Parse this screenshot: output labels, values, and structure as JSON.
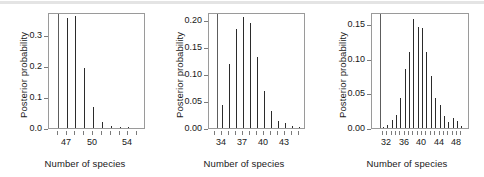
{
  "figure": {
    "panel_count": 3,
    "axis_color": "#7b7b7b",
    "box_color": "#9a9a9a",
    "spike_color": "#2b2b2b",
    "refline_color": "#5d5d5d",
    "background": "#ffffff"
  },
  "chart_data": [
    {
      "type": "bar",
      "title": "",
      "xlabel": "Number of species",
      "ylabel": "Posterior probability",
      "xlim": [
        45.0,
        56.0
      ],
      "ylim": [
        0.0,
        0.375
      ],
      "xticks": [
        47,
        50,
        54
      ],
      "xtick_labels": [
        "47",
        "50",
        "54"
      ],
      "xtick_minor": [
        46,
        47,
        48,
        49,
        50,
        51,
        52,
        53,
        54,
        55
      ],
      "yticks": [
        0.0,
        0.1,
        0.2,
        0.3
      ],
      "ytick_labels": [
        "0.0",
        "0.1",
        "0.2",
        "0.3"
      ],
      "grid": false,
      "legend": false,
      "reference_line_x": 46,
      "categories": [
        47,
        48,
        49,
        50,
        51,
        52,
        53,
        54
      ],
      "values": [
        0.355,
        0.362,
        0.193,
        0.068,
        0.018,
        0.006,
        0.002,
        0.004
      ]
    },
    {
      "type": "bar",
      "title": "",
      "xlabel": "Number of species",
      "ylabel": "Posterior probability",
      "xlim": [
        32.2,
        46.0
      ],
      "ylim": [
        0.0,
        0.215
      ],
      "xticks": [
        34,
        37,
        40,
        43
      ],
      "xtick_labels": [
        "34",
        "37",
        "40",
        "43"
      ],
      "xtick_minor": [
        33,
        34,
        35,
        36,
        37,
        38,
        39,
        40,
        41,
        42,
        43,
        44,
        45
      ],
      "yticks": [
        0.0,
        0.05,
        0.1,
        0.15,
        0.2
      ],
      "ytick_labels": [
        "0.00",
        "0.05",
        "0.10",
        "0.15",
        "0.20"
      ],
      "grid": false,
      "legend": false,
      "reference_line_x": 33.4,
      "categories": [
        34,
        35,
        36,
        37,
        38,
        39,
        40,
        41,
        42,
        43,
        44,
        45
      ],
      "values": [
        0.043,
        0.118,
        0.183,
        0.206,
        0.194,
        0.131,
        0.068,
        0.031,
        0.013,
        0.009,
        0.004,
        0.002
      ]
    },
    {
      "type": "bar",
      "title": "",
      "xlabel": "Number of species",
      "ylabel": "Posterior probability",
      "xlim": [
        28.5,
        51.0
      ],
      "ylim": [
        0.0,
        0.168
      ],
      "xticks": [
        32,
        36,
        40,
        44,
        48
      ],
      "xtick_labels": [
        "32",
        "36",
        "40",
        "44",
        "48"
      ],
      "xtick_minor": [
        31,
        32,
        33,
        34,
        35,
        36,
        37,
        38,
        39,
        40,
        41,
        42,
        43,
        44,
        45,
        46,
        47,
        48,
        49
      ],
      "yticks": [
        0.0,
        0.05,
        0.1,
        0.15
      ],
      "ytick_labels": [
        "0.00",
        "0.05",
        "0.10",
        "0.15"
      ],
      "grid": false,
      "legend": false,
      "reference_line_x": 30.4,
      "categories": [
        31,
        32,
        33,
        34,
        35,
        36,
        37,
        38,
        39,
        40,
        41,
        42,
        43,
        44,
        45,
        46,
        47,
        48,
        49
      ],
      "values": [
        0.002,
        0.005,
        0.012,
        0.019,
        0.043,
        0.085,
        0.11,
        0.158,
        0.146,
        0.145,
        0.11,
        0.076,
        0.044,
        0.034,
        0.018,
        0.009,
        0.014,
        0.01,
        0.003
      ]
    }
  ]
}
